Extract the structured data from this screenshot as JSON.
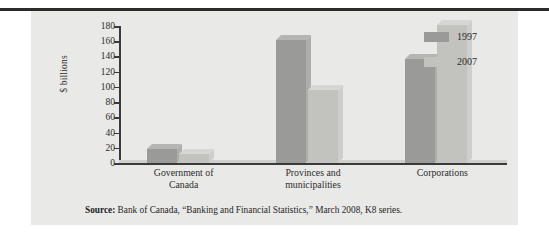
{
  "figure": {
    "panel_bg": "#e9e9e7",
    "source_prefix": "Source:",
    "source_text": " Bank of Canada, “Banking and Financial Statistics,” March 2008, K8 series."
  },
  "chart_data": {
    "type": "bar",
    "title": "",
    "xlabel": "",
    "ylabel": "$ billions",
    "categories": [
      "Government of Canada",
      "Provinces and municipalities",
      "Corporations"
    ],
    "category_lines": [
      [
        "Government of",
        "Canada"
      ],
      [
        "Provinces and",
        "municipalities"
      ],
      [
        "Corporations"
      ]
    ],
    "series": [
      {
        "name": "1997",
        "color": "#9a9a98",
        "values": [
          19,
          161,
          137
        ]
      },
      {
        "name": "2007",
        "color": "#c2c2be",
        "values": [
          12,
          96,
          181
        ]
      }
    ],
    "ylim": [
      0,
      180
    ],
    "yticks": [
      0,
      20,
      40,
      60,
      80,
      100,
      120,
      140,
      160,
      180
    ],
    "ytick_labels": [
      "0",
      "20",
      "40",
      "60",
      "80",
      "100",
      "120",
      "140",
      "160",
      "180"
    ],
    "grid": false,
    "legend_position": "right",
    "legend_entries": [
      "1997",
      "2007"
    ]
  }
}
